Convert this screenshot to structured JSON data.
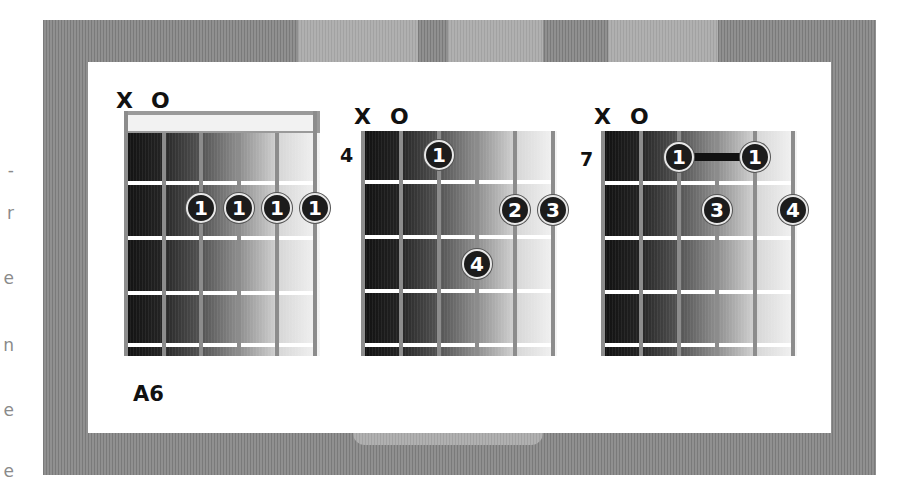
{
  "clipped_left_text": [
    "-",
    "r",
    "e",
    "n",
    "e",
    "e"
  ],
  "chords": [
    {
      "name": "A6",
      "string_markers": [
        "X",
        "O"
      ],
      "start_fret": "",
      "has_nut": true,
      "fingers": [
        {
          "string": 3,
          "fret": 2,
          "finger": "1"
        },
        {
          "string": 4,
          "fret": 2,
          "finger": "1"
        },
        {
          "string": 5,
          "fret": 2,
          "finger": "1"
        },
        {
          "string": 6,
          "fret": 2,
          "finger": "1"
        }
      ]
    },
    {
      "name": "",
      "string_markers": [
        "X",
        "O"
      ],
      "start_fret": "4",
      "has_nut": false,
      "fingers": [
        {
          "string": 3,
          "fret": 1,
          "finger": "1"
        },
        {
          "string": 5,
          "fret": 2,
          "finger": "2"
        },
        {
          "string": 6,
          "fret": 2,
          "finger": "3"
        },
        {
          "string": 4,
          "fret": 3,
          "finger": "4"
        }
      ]
    },
    {
      "name": "",
      "string_markers": [
        "X",
        "O"
      ],
      "start_fret": "7",
      "has_nut": false,
      "barre": {
        "from_string": 3,
        "to_string": 5,
        "fret": 1
      },
      "fingers": [
        {
          "string": 3,
          "fret": 1,
          "finger": "1"
        },
        {
          "string": 5,
          "fret": 1,
          "finger": "1"
        },
        {
          "string": 4,
          "fret": 2,
          "finger": "3"
        },
        {
          "string": 6,
          "fret": 2,
          "finger": "4"
        }
      ]
    }
  ],
  "colors": {
    "frame": "#888888",
    "card": "#ffffff",
    "dot": "#1c1c1c",
    "string": "#8c8c8c",
    "text": "#111111"
  }
}
